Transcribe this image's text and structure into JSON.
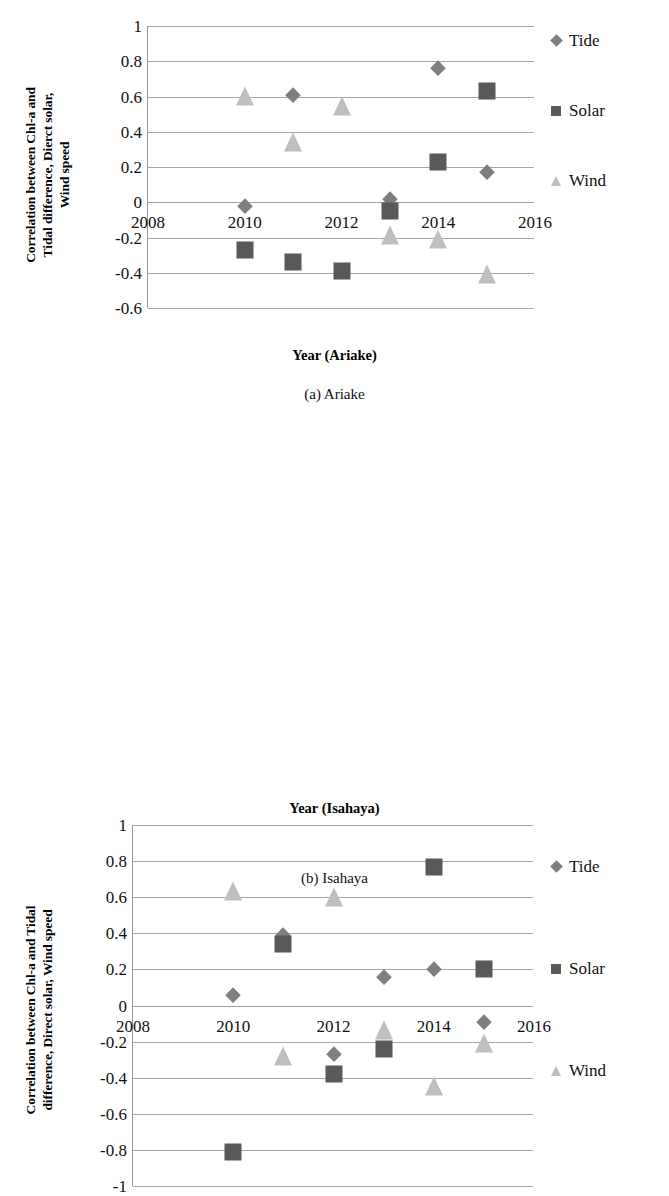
{
  "figures": [
    {
      "id": "a",
      "caption": "(a) Ariake",
      "ytitle": "Correlation between Chl-a and\nTidal difference, Dierct solar,\nWind speed",
      "xtitle": "Year (Ariake)",
      "legend": [
        {
          "name": "Tide",
          "shape": "diamond",
          "color": "#7f7f7f"
        },
        {
          "name": "Solar",
          "shape": "square",
          "color": "#595959"
        },
        {
          "name": "Wind",
          "shape": "triangle",
          "color": "#bfbfbf"
        }
      ],
      "chart_data": {
        "type": "scatter",
        "title": "(a) Ariake",
        "xlabel": "Year (Ariake)",
        "ylabel": "Correlation between Chl-a and Tidal difference, Dierct solar, Wind speed",
        "xlim": [
          2008,
          2016
        ],
        "ylim": [
          -0.6,
          1
        ],
        "xticks": [
          2008,
          2010,
          2012,
          2014,
          2016
        ],
        "yticks": [
          1,
          0.8,
          0.6,
          0.4,
          0.2,
          0,
          -0.2,
          -0.4,
          -0.6
        ],
        "grid": true,
        "legend_position": "right",
        "series": [
          {
            "name": "Tide",
            "marker": "diamond",
            "color": "#7f7f7f",
            "x": [
              2010,
              2011,
              2013,
              2014,
              2015
            ],
            "y": [
              -0.02,
              0.61,
              0.02,
              0.76,
              0.17
            ]
          },
          {
            "name": "Solar",
            "marker": "square",
            "color": "#595959",
            "x": [
              2010,
              2011,
              2012,
              2013,
              2014,
              2015
            ],
            "y": [
              -0.27,
              -0.34,
              -0.39,
              -0.05,
              0.23,
              0.63
            ]
          },
          {
            "name": "Wind",
            "marker": "triangle",
            "color": "#bfbfbf",
            "x": [
              2010,
              2011,
              2012,
              2013,
              2014,
              2015
            ],
            "y": [
              0.55,
              0.29,
              0.49,
              -0.24,
              -0.26,
              -0.46
            ]
          }
        ]
      }
    },
    {
      "id": "b",
      "caption": "(b) Isahaya",
      "ytitle": "Correlation between Chl-a and Tidal\ndifference, Direct solar, Wind speed",
      "xtitle": "Year (Isahaya)",
      "legend": [
        {
          "name": "Tide",
          "shape": "diamond",
          "color": "#7f7f7f"
        },
        {
          "name": "Solar",
          "shape": "square",
          "color": "#595959"
        },
        {
          "name": "Wind",
          "shape": "triangle",
          "color": "#bfbfbf"
        }
      ],
      "chart_data": {
        "type": "scatter",
        "title": "(b) Isahaya",
        "xlabel": "Year (Isahaya)",
        "ylabel": "Correlation between Chl-a and Tidal difference, Direct solar, Wind speed",
        "xlim": [
          2008,
          2016
        ],
        "ylim": [
          -1,
          1
        ],
        "xticks": [
          2008,
          2010,
          2012,
          2014,
          2016
        ],
        "yticks": [
          1,
          0.8,
          0.6,
          0.4,
          0.2,
          0,
          -0.2,
          -0.4,
          -0.6,
          -0.8,
          -1
        ],
        "grid": true,
        "legend_position": "right",
        "series": [
          {
            "name": "Tide",
            "marker": "diamond",
            "color": "#7f7f7f",
            "x": [
              2010,
              2011,
              2012,
              2013,
              2014,
              2015
            ],
            "y": [
              0.06,
              0.39,
              -0.27,
              0.16,
              0.2,
              -0.09
            ]
          },
          {
            "name": "Solar",
            "marker": "square",
            "color": "#595959",
            "x": [
              2010,
              2011,
              2012,
              2013,
              2014,
              2015
            ],
            "y": [
              -0.81,
              0.34,
              -0.38,
              -0.24,
              0.77,
              0.2
            ]
          },
          {
            "name": "Wind",
            "marker": "triangle",
            "color": "#bfbfbf",
            "x": [
              2010,
              2011,
              2012,
              2013,
              2014,
              2015
            ],
            "y": [
              0.58,
              -0.33,
              0.55,
              -0.19,
              -0.5,
              -0.26
            ]
          }
        ]
      }
    }
  ]
}
